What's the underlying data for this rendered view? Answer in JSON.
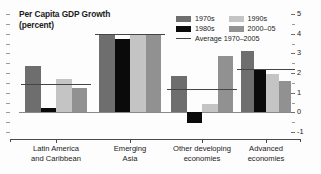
{
  "chart_data": {
    "type": "bar",
    "title": "Per Capita GDP Growth",
    "subtitle": "(percent)",
    "xlabel": "",
    "ylabel": "",
    "ylim": [
      -1,
      5
    ],
    "yticks": [
      5,
      4,
      3,
      2,
      1,
      0,
      -1
    ],
    "ytick_labels": [
      "5",
      "4",
      "3",
      "2",
      "1",
      "0",
      "-1"
    ],
    "y_axis_position": "right",
    "grid": false,
    "legend_position": "top-right",
    "categories": [
      "Latin America and Caribbean",
      "Emerging Asia",
      "Other developing economies",
      "Advanced economies"
    ],
    "category_lines": [
      [
        "Latin America",
        "and Caribbean"
      ],
      [
        "Emerging",
        "Asia"
      ],
      [
        "Other developing",
        "economies"
      ],
      [
        "Advanced",
        "economies"
      ]
    ],
    "series": [
      {
        "name": "1970s",
        "color": "#6e6e6e",
        "values": [
          2.35,
          3.95,
          1.85,
          3.1
        ]
      },
      {
        "name": "1980s",
        "color": "#0a0a0a",
        "values": [
          0.2,
          3.75,
          -0.55,
          2.2
        ]
      },
      {
        "name": "1990s",
        "color": "#c4c4c4",
        "values": [
          1.7,
          3.95,
          0.4,
          1.95
        ]
      },
      {
        "name": "2000-05",
        "color": "#919191",
        "values": [
          1.25,
          3.95,
          2.85,
          1.6
        ]
      }
    ],
    "average_series": {
      "name": "Average 1970-2005",
      "color": "#43454a",
      "values": [
        1.45,
        3.98,
        1.2,
        2.2
      ]
    }
  },
  "legend": {
    "items": [
      {
        "label": "1970s",
        "color": "#6e6e6e"
      },
      {
        "label": "1990s",
        "color": "#c4c4c4"
      },
      {
        "label": "1980s",
        "color": "#0a0a0a"
      },
      {
        "label": "2000–05",
        "color": "#919191"
      }
    ],
    "average_label": "Average 1970–2005",
    "average_color": "#43454a"
  },
  "title": {
    "line1": "Per Capita GDP Growth",
    "line2": "(percent)"
  },
  "axis": {
    "labels": [
      "5",
      "4",
      "3",
      "2",
      "1",
      "0",
      "-1"
    ]
  },
  "categories": [
    {
      "line1": "Latin America",
      "line2": "and Caribbean"
    },
    {
      "line1": "Emerging",
      "line2": "Asia"
    },
    {
      "line1": "Other developing",
      "line2": "economies"
    },
    {
      "line1": "Advanced",
      "line2": "economies"
    }
  ]
}
